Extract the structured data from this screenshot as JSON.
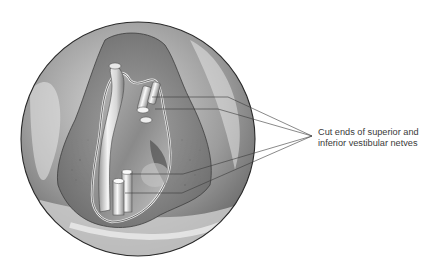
{
  "figure": {
    "title": "",
    "callout": {
      "line1": "Cut ends of superior and",
      "line2": "inferior vestibular netves"
    },
    "colors": {
      "background": "#ffffff",
      "circle_outline": "#2a2a2a",
      "tissue_light": "#e4e4e4",
      "tissue_mid": "#a8a8a8",
      "tissue_dark": "#5a5a5a",
      "leader_line": "#3a3a3a",
      "label_text": "#3a3a3a"
    },
    "leader_lines": [
      {
        "start": [
          152,
          97
        ],
        "bend": [
          228,
          97
        ],
        "end": [
          312,
          136
        ]
      },
      {
        "start": [
          155,
          109
        ],
        "bend": [
          218,
          109
        ],
        "end": [
          312,
          136
        ]
      },
      {
        "start": [
          130,
          174
        ],
        "bend": [
          183,
          174
        ],
        "end": [
          312,
          136
        ]
      },
      {
        "start": [
          125,
          193
        ],
        "bend": [
          182,
          193
        ],
        "end": [
          312,
          136
        ]
      }
    ]
  }
}
